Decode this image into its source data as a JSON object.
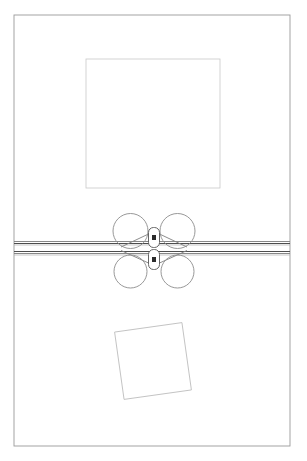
{
  "document": {
    "title": "Mechanical Assembly Line Drawing",
    "width": 307,
    "height": 461,
    "background_color": "#ffffff",
    "style": "monochrome technical line art, no text labels"
  },
  "colors": {
    "background": "#ffffff",
    "page_border": "#9a9a9a",
    "upper_rectangle_stroke": "#c9c9c9",
    "tilted_square_stroke": "#c0c0c0",
    "circle_stroke": "#8c8c8c",
    "rail_stroke_dark": "#4d4d4d",
    "rail_stroke_mid": "#7a7a7a",
    "rail_stroke_light": "#b0b0b0",
    "latch_stroke": "#555555",
    "latch_mark_fill": "#2b2b2b",
    "arm_stroke": "#7f7f7f"
  },
  "page_border": {
    "name": "page-border",
    "x": 14,
    "y": 15,
    "width": 276,
    "height": 431,
    "stroke_width": 0.9
  },
  "upper_rectangle": {
    "name": "upper-rectangle",
    "x": 86,
    "y": 59,
    "width": 134,
    "height": 129,
    "stroke_width": 0.8
  },
  "tilted_square": {
    "name": "tilted-square",
    "center_x": 153,
    "center_y": 361,
    "size": 68,
    "rotation_degrees": -8,
    "stroke_width": 0.9
  },
  "rails": {
    "name": "horizontal-rail-band",
    "x_start": 14,
    "x_end": 290,
    "center_y": 248,
    "lines": [
      {
        "y": 241.5,
        "width": 0.9,
        "shade": "mid"
      },
      {
        "y": 243.5,
        "width": 1.1,
        "shade": "dark"
      },
      {
        "y": 245.0,
        "width": 0.7,
        "shade": "light"
      },
      {
        "y": 251.5,
        "width": 1.1,
        "shade": "dark"
      },
      {
        "y": 253.5,
        "width": 0.9,
        "shade": "mid"
      },
      {
        "y": 255.0,
        "width": 0.7,
        "shade": "light"
      }
    ]
  },
  "rollers": [
    {
      "name": "roller-top-left",
      "cx": 130.5,
      "cy": 231.0,
      "r": 17.5
    },
    {
      "name": "roller-top-right",
      "cx": 177.5,
      "cy": 231.0,
      "r": 17.5
    },
    {
      "name": "roller-bottom-left",
      "cx": 130.5,
      "cy": 271.5,
      "r": 16.5
    },
    {
      "name": "roller-bottom-right",
      "cx": 177.5,
      "cy": 271.5,
      "r": 16.5
    }
  ],
  "latches": [
    {
      "name": "latch-upper",
      "cx": 154.0,
      "cy": 237.5,
      "width": 11,
      "height": 20,
      "corner_radius": 5,
      "mark_width": 4,
      "mark_height": 5
    },
    {
      "name": "latch-lower",
      "cx": 154.0,
      "cy": 259.5,
      "width": 11,
      "height": 20,
      "corner_radius": 5,
      "mark_width": 4,
      "mark_height": 5
    }
  ],
  "connecting_arms": [
    {
      "name": "arm-upper-left",
      "x1": 121.0,
      "y1": 247.0,
      "x2": 148.5,
      "y2": 234.0
    },
    {
      "name": "arm-upper-right",
      "x1": 187.0,
      "y1": 247.0,
      "x2": 159.5,
      "y2": 234.0
    },
    {
      "name": "arm-lower-left",
      "x1": 121.0,
      "y1": 250.5,
      "x2": 148.5,
      "y2": 263.0
    },
    {
      "name": "arm-lower-right",
      "x1": 187.0,
      "y1": 250.5,
      "x2": 159.5,
      "y2": 263.0
    }
  ],
  "annotations": {
    "shape_count_label": "4 rollers, 2 latches, 6 rail lines",
    "visible_text": "none"
  }
}
